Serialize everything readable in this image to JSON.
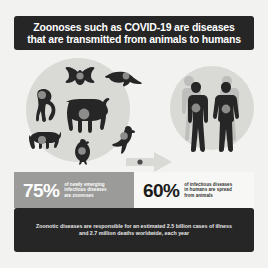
{
  "header": {
    "line1": "Zoonoses such as COVID-19 are diseases",
    "line2": "that are transmitted from animals to humans",
    "background_color": "#262626",
    "text_color": "#ffffff"
  },
  "illustration": {
    "animals_group_label": "animals-group",
    "humans_group_label": "humans-group",
    "transmission_arrow_label": "transmission-arrow",
    "blob_color": "#d9d9d6",
    "silhouette_color": "#262626",
    "virus_marker_color": "#8c8c8a",
    "animals": [
      "monkey-silhouette",
      "bat-silhouette",
      "pangolin-silhouette",
      "cow-silhouette",
      "pig-silhouette",
      "chicken-silhouette",
      "bird-silhouette"
    ],
    "humans": [
      "human-male-silhouette",
      "human-female-silhouette"
    ]
  },
  "stats": [
    {
      "value": "75%",
      "description_line1": "of newly emerging",
      "description_line2": "infectious diseases",
      "description_line3": "are zoonoses",
      "background_color": "#9b9b99",
      "text_color": "#ffffff"
    },
    {
      "value": "60%",
      "description_line1": "of infectious diseases",
      "description_line2": "in humans are spread",
      "description_line3": "from animals",
      "background_color": "#f7f7f5",
      "text_color": "#333333"
    }
  ],
  "footer": {
    "line1": "Zoonotic diseases are responsible for an estimated 2.5 billion cases of illness",
    "line2": "and 2.7 million deaths worldwide, each year",
    "background_color": "#262626",
    "text_color": "#e8e8e8"
  }
}
